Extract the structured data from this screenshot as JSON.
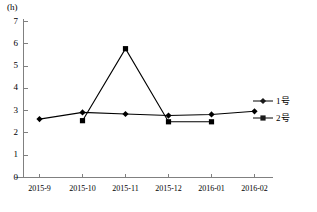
{
  "chart_data": {
    "type": "line",
    "title": "",
    "xlabel": "",
    "ylabel": "(h)",
    "ylim": [
      0,
      7
    ],
    "yticks": [
      "0",
      "1",
      "2",
      "3",
      "4",
      "5",
      "6",
      "7"
    ],
    "grid": false,
    "legend_position": "right",
    "categories": [
      "2015-9",
      "2015-10",
      "2015-11",
      "2015-12",
      "2016-01",
      "2016-02"
    ],
    "series": [
      {
        "name": "1号",
        "marker": "diamond",
        "color": "#000000",
        "values": [
          2.62,
          2.92,
          2.85,
          2.78,
          2.83,
          2.97
        ]
      },
      {
        "name": "2号",
        "marker": "square",
        "color": "#000000",
        "values": [
          null,
          2.55,
          5.78,
          2.5,
          2.5,
          null
        ]
      }
    ]
  },
  "axes": {
    "y_unit_label": "(h)"
  },
  "legend": {
    "items": [
      {
        "label": "1号",
        "marker": "diamond-marker"
      },
      {
        "label": "2号",
        "marker": "square-marker"
      }
    ]
  },
  "style": {
    "line_color": "#1a1a1a",
    "axis_color": "#808080",
    "background": "#ffffff"
  }
}
